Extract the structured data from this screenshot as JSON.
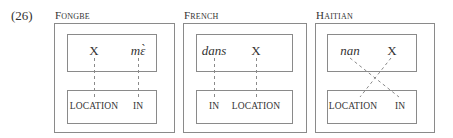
{
  "example_number": "(26)",
  "panels": [
    {
      "title": "Fongbe",
      "top_row": [
        {
          "text": "X",
          "italic": false
        },
        {
          "text": "mɛ̀",
          "italic": true
        }
      ],
      "bottom_row": [
        "LOCATION",
        "IN"
      ],
      "links": [
        {
          "from": "X",
          "to": "LOCATION",
          "style": "dashed"
        },
        {
          "from": "mɛ̀",
          "to": "IN",
          "style": "dashed"
        }
      ]
    },
    {
      "title": "French",
      "top_row": [
        {
          "text": "dans",
          "italic": true
        },
        {
          "text": "X",
          "italic": false
        }
      ],
      "bottom_row": [
        "IN",
        "LOCATION"
      ],
      "links": [
        {
          "from": "dans",
          "to": "IN",
          "style": "dashed"
        },
        {
          "from": "X",
          "to": "LOCATION",
          "style": "dashed"
        }
      ]
    },
    {
      "title": "Haitian",
      "top_row": [
        {
          "text": "nan",
          "italic": true
        },
        {
          "text": "X",
          "italic": false
        }
      ],
      "bottom_row": [
        "LOCATION",
        "IN"
      ],
      "links": [
        {
          "from": "nan",
          "to": "IN",
          "style": "dashed-crossing"
        },
        {
          "from": "X",
          "to": "LOCATION",
          "style": "dashed-crossing"
        }
      ]
    }
  ],
  "colors": {
    "box_border": "#8a8a8a",
    "dash_line": "#8a8a8a",
    "text": "#333333"
  }
}
